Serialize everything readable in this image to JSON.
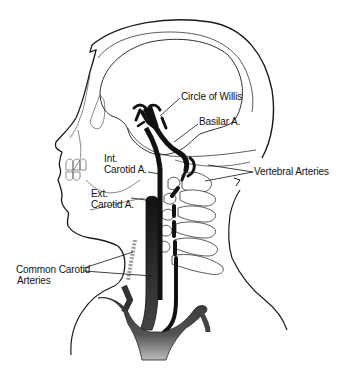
{
  "diagram": {
    "colors": {
      "line": "#1a1a1a",
      "artery": "#111111",
      "background": "#ffffff"
    },
    "labels": {
      "circle_of_willis": "Circle of Willis",
      "basilar": "Basilar A.",
      "int_carotid_line1": "Int.",
      "int_carotid_line2": "Carotid A.",
      "ext_carotid_line1": "Ext.",
      "ext_carotid_line2": "Carotid A.",
      "vertebral": "Vertebral Arteries",
      "common_carotid_line1": "Common Carotid",
      "common_carotid_line2": "Arteries"
    }
  }
}
